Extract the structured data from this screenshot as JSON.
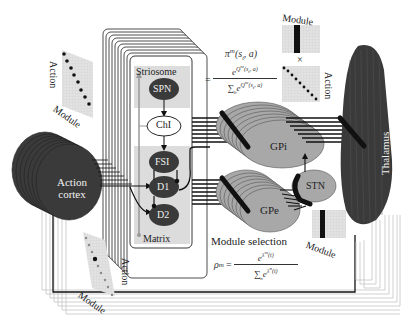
{
  "diagram": {
    "regions": {
      "action_cortex": {
        "label_line1": "Action",
        "label_line2": "cortex"
      },
      "striatum": {
        "striosome_label": "Striosome",
        "matrix_label": "Matrix",
        "nodes": [
          "SPN",
          "ChI",
          "FSI",
          "D1",
          "D2"
        ]
      },
      "gpi": {
        "label": "GPi"
      },
      "gpe": {
        "label": "GPe"
      },
      "stn": {
        "label": "STN"
      },
      "thalamus": {
        "label": "Thalamus"
      }
    },
    "matrices": {
      "top_left": {
        "row_label": "Action",
        "col_label": "Module"
      },
      "top_right": {
        "top_label": "Module",
        "times": "×",
        "side_label": "Action"
      },
      "bottom_left": {
        "row_label": "Action",
        "col_label": "Module"
      },
      "bottom_right": {
        "label": "Module"
      }
    },
    "equations": {
      "policy": {
        "lhs": "π",
        "lhs_sup": "m",
        "lhs_args": "(s",
        "lhs_sub": "t",
        "lhs_args2": ", a)",
        "eq": "=",
        "numerator": "e",
        "numerator_exp": "Q",
        "numerator_exp_sup": "m",
        "numerator_exp_args": "(s",
        "numerator_exp_sub": "t",
        "numerator_exp_args2": ", a)",
        "denominator_sum": "∑",
        "denominator_sum_sub": "b",
        "denominator": "e",
        "denominator_exp": "Q",
        "denominator_exp_sup": "m",
        "denominator_exp_args": "(s",
        "denominator_exp_sub": "t",
        "denominator_exp_args2": ", a)"
      },
      "module_selection": {
        "title": "Module selection",
        "lhs": "ρ",
        "lhs_sup": "m",
        "eq": "=",
        "numerator": "e",
        "numerator_exp": "λ",
        "numerator_exp_sup": "m",
        "numerator_exp_args": "(t)",
        "denominator_sum": "∑",
        "denominator_sum_sub": "n",
        "denominator": "e",
        "denominator_exp": "λ",
        "denominator_exp_sup": "n",
        "denominator_exp_args": "(t)"
      }
    },
    "colors": {
      "dark_node": "#3a3a3a",
      "gray_node": "#a8a8a8",
      "light_panel": "#dcdcdc",
      "line_dark": "#111111",
      "line_light": "#bbbbbb",
      "background": "#ffffff"
    }
  }
}
